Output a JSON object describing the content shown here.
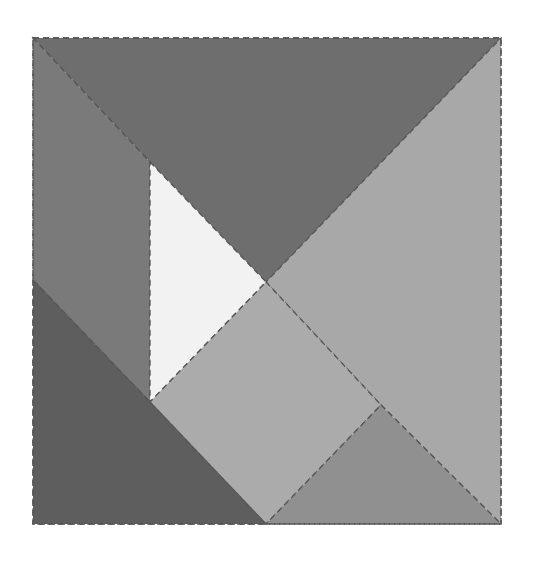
{
  "diagram": {
    "type": "tangram-square",
    "width": 534,
    "height": 564,
    "background": "#ffffff",
    "outline": {
      "x1": 33,
      "y1": 38,
      "x2": 501,
      "y2": 524,
      "stroke": "#555555"
    },
    "pieces": [
      {
        "name": "top-large-triangle",
        "color": "#6e6e6e",
        "points": "33,38 501,38 266,282 150,162"
      },
      {
        "name": "left-parallelogram",
        "color": "#7a7a7a",
        "points": "33,38 150,162 150,402 33,280"
      },
      {
        "name": "white-small-triangle",
        "color": "#f2f2f2",
        "points": "150,162 266,282 150,402"
      },
      {
        "name": "right-large-triangle",
        "color": "#a8a8a8",
        "points": "501,38 501,524 381,405 266,282"
      },
      {
        "name": "center-square",
        "color": "#ababab",
        "points": "266,282 381,405 266,524 150,402"
      },
      {
        "name": "bottom-left-triangle",
        "color": "#5e5e5e",
        "points": "33,280 150,402 266,524 33,524"
      },
      {
        "name": "bottom-right-triangle",
        "color": "#909090",
        "points": "381,405 501,524 266,524"
      }
    ]
  }
}
